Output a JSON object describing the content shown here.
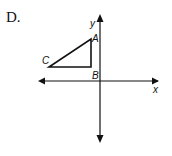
{
  "problem_label": "D.",
  "axes": {
    "x_label": "x",
    "y_label": "y"
  },
  "triangle": {
    "vertices": [
      {
        "name": "A",
        "position": "upper right, left of y-axis"
      },
      {
        "name": "B",
        "position": "right-angle vertex, directly below A"
      },
      {
        "name": "C",
        "position": "left vertex, level with B"
      }
    ]
  },
  "colors": {
    "stroke": "#111111",
    "background": "#ffffff"
  }
}
